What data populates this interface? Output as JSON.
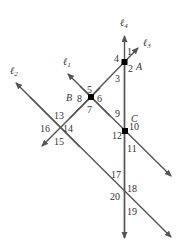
{
  "diagram": {
    "type": "parallel-lines-transversals",
    "line_color": "#555555",
    "point_color": "#000000",
    "lines": [
      {
        "id": "l1",
        "label": "ℓ",
        "sub": "1"
      },
      {
        "id": "l2",
        "label": "ℓ",
        "sub": "2"
      },
      {
        "id": "l3",
        "label": "ℓ",
        "sub": "3"
      },
      {
        "id": "l4",
        "label": "ℓ",
        "sub": "4"
      }
    ],
    "points": [
      {
        "id": "A",
        "label": "A"
      },
      {
        "id": "B",
        "label": "B"
      },
      {
        "id": "C",
        "label": "C"
      }
    ],
    "angles": [
      "1",
      "2",
      "3",
      "4",
      "5",
      "6",
      "7",
      "8",
      "9",
      "10",
      "11",
      "12",
      "13",
      "14",
      "15",
      "16",
      "17",
      "18",
      "19",
      "20"
    ]
  }
}
